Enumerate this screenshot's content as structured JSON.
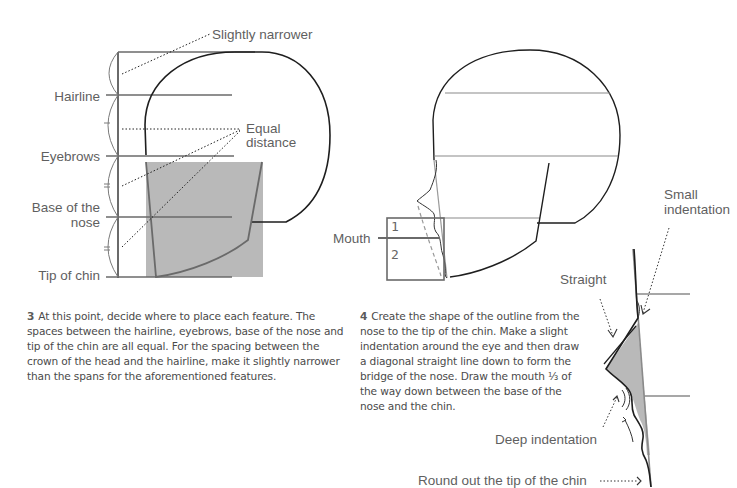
{
  "step3": {
    "labels": {
      "top_annotation": "Slightly narrower",
      "hairline": "Hairline",
      "eyebrows": "Eyebrows",
      "base_of_nose_line1": "Base of the",
      "base_of_nose_line2": "nose",
      "tip_of_chin": "Tip of chin",
      "equal_line1": "Equal",
      "equal_line2": "distance"
    },
    "caption_number": "3",
    "caption_text": "At this point, decide where to place each feature. The spaces between the hairline, eyebrows, base of the nose and tip of the chin are all equal. For the spacing between the crown of the head and the hairline, make it slightly narrower than the spans for the aforementioned features."
  },
  "step4": {
    "labels": {
      "mouth": "Mouth",
      "box_part_1": "1",
      "box_part_2": "2",
      "small_indentation_line1": "Small",
      "small_indentation_line2": "indentation",
      "straight": "Straight",
      "deep_indentation": "Deep indentation",
      "round_chin": "Round out the tip of the chin"
    },
    "caption_number": "4",
    "caption_text_before_fraction": "Create the shape of the outline from the nose to the tip of the chin. Make a slight indentation around the eye and then draw a diagonal straight line down to form the bridge of the nose. Draw the mouth ",
    "caption_fraction": "⅓",
    "caption_text_after_fraction": " of the way down between the base of the nose and the chin."
  },
  "colors": {
    "guide_line": "#6a6a6a",
    "outline": "#1e1e1e",
    "shade": "#b9b9b9",
    "label_text": "#5f5f5f"
  }
}
